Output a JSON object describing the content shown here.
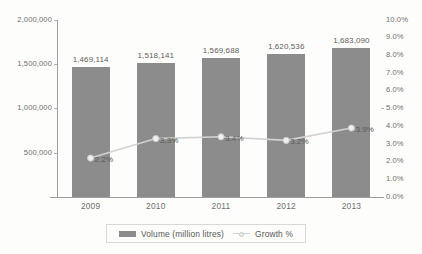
{
  "chart_data": {
    "type": "bar",
    "title": "",
    "subtitle": "",
    "xlabel": "",
    "ylabel": "",
    "categories": [
      "2009",
      "2010",
      "2011",
      "2012",
      "2013"
    ],
    "series": [
      {
        "name": "Volume (million litres)",
        "type": "bar",
        "axis": "left",
        "color": "#8c8c8c",
        "values": [
          1469114,
          1518141,
          1569688,
          1620536,
          1683090
        ],
        "value_labels": [
          "1,469,114",
          "1,518,141",
          "1,569,688",
          "1,620,536",
          "1,683,090"
        ]
      },
      {
        "name": "Growth %",
        "type": "line",
        "axis": "right",
        "color": "#d2d2d2",
        "values": [
          2.2,
          3.3,
          3.4,
          3.2,
          3.9
        ],
        "value_labels": [
          "2.2%",
          "3.3%",
          "3.4%",
          "3.2%",
          "3.9%"
        ]
      }
    ],
    "left_axis": {
      "min": 0,
      "max": 2000000,
      "step": 500000,
      "tick_labels": [
        "2,000,000",
        "1,500,000",
        "1,000,000",
        "500,000",
        ""
      ]
    },
    "right_axis": {
      "min": 0,
      "max": 10,
      "step": 1,
      "tick_labels": [
        "10.0%",
        "9.0%",
        "8.0%",
        "7.0%",
        "6.0%",
        "5.0%",
        "4.0%",
        "3.0%",
        "2.0%",
        "1.0%",
        "0.0%"
      ]
    },
    "grid": false,
    "legend_position": "bottom"
  },
  "legend": {
    "entries": [
      {
        "label": "Volume (million litres)"
      },
      {
        "label": "Growth %"
      }
    ]
  }
}
